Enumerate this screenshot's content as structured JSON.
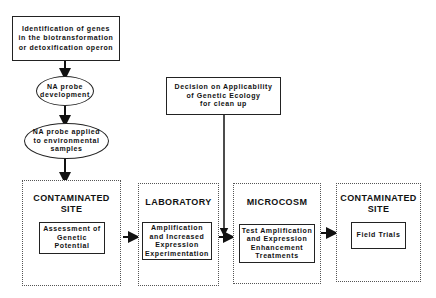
{
  "top_flow": {
    "identification_box": {
      "lines": [
        "Identification of genes",
        "in the biotransformation",
        "or detoxification operon"
      ]
    },
    "probe_development": {
      "lines": [
        "NA probe",
        "development"
      ]
    },
    "probe_applied": {
      "lines": [
        "NA probe applied",
        "to environmental",
        "samples"
      ]
    }
  },
  "decision_box": {
    "lines": [
      "Decision on Applicability",
      "of Genetic Ecology",
      "for clean up"
    ]
  },
  "stages": [
    {
      "title_lines": [
        "CONTAMINATED",
        "SITE"
      ],
      "inner_lines": [
        "Assessment of",
        "Genetic",
        "Potential"
      ]
    },
    {
      "title_lines": [
        "LABORATORY"
      ],
      "inner_lines": [
        "Amplification",
        "and Increased",
        "Expression",
        "Experimentation"
      ]
    },
    {
      "title_lines": [
        "MICROCOSM"
      ],
      "inner_lines": [
        "Test Amplification",
        "and Expression",
        "Enhancement",
        "Treatments"
      ]
    },
    {
      "title_lines": [
        "CONTAMINATED",
        "SITE"
      ],
      "inner_lines": [
        "Field Trials"
      ]
    }
  ],
  "colors": {
    "line": "#111111",
    "dotted_border": "#555555",
    "background": "#ffffff"
  }
}
